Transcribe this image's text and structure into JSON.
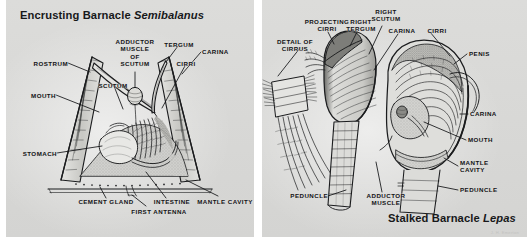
{
  "figure": {
    "kind": "anatomical-illustration",
    "panels": 2,
    "background_color": "#d8d8d6",
    "ink_color": "#1b1c1e",
    "signature": "J. H. Emerton"
  },
  "left_panel": {
    "title_prefix": "Encrusting Barnacle ",
    "title_genus": "Semibalanus",
    "view": "vertical section through conical shell",
    "labels": [
      {
        "id": "rostrum",
        "text": "ROSTRUM",
        "lines": [
          "ROSTRUM"
        ],
        "align": "right"
      },
      {
        "id": "mouth",
        "text": "MOUTH",
        "lines": [
          "MOUTH"
        ],
        "align": "right"
      },
      {
        "id": "stomach",
        "text": "STOMACH",
        "lines": [
          "STOMACH"
        ],
        "align": "right"
      },
      {
        "id": "adductor-muscle-of-scutum",
        "text": "ADDUCTOR MUSCLE OF SCUTUM",
        "lines": [
          "ADDUCTOR",
          "MUSCLE",
          "OF",
          "SCUTUM"
        ],
        "align": "center"
      },
      {
        "id": "tergum",
        "text": "TERGUM",
        "lines": [
          "TERGUM"
        ],
        "align": "center"
      },
      {
        "id": "carina",
        "text": "CARINA",
        "lines": [
          "CARINA"
        ],
        "align": "left"
      },
      {
        "id": "cirri",
        "text": "CIRRI",
        "lines": [
          "CIRRI"
        ],
        "align": "center"
      },
      {
        "id": "scutum",
        "text": "SCUTUM",
        "lines": [
          "SCUTUM"
        ],
        "align": "center"
      },
      {
        "id": "cement-gland",
        "text": "CEMENT GLAND",
        "lines": [
          "CEMENT GLAND"
        ],
        "align": "center"
      },
      {
        "id": "first-antenna",
        "text": "FIRST ANTENNA",
        "lines": [
          "FIRST ANTENNA"
        ],
        "align": "center"
      },
      {
        "id": "intestine",
        "text": "INTESTINE",
        "lines": [
          "INTESTINE"
        ],
        "align": "center"
      },
      {
        "id": "mantle-cavity",
        "text": "MANTLE CAVITY",
        "lines": [
          "MANTLE CAVITY"
        ],
        "align": "center"
      }
    ]
  },
  "right_panel": {
    "title_prefix": "Stalked Barnacle ",
    "title_genus": "Lepas",
    "view": "detail of cirrus, whole animal, and opened capitulum",
    "labels": [
      {
        "id": "detail-of-cirrus",
        "text": "DETAIL OF CIRRUS",
        "lines": [
          "DETAIL OF",
          "CIRRUS"
        ],
        "align": "center"
      },
      {
        "id": "projecting-cirri",
        "text": "PROJECTING CIRRI",
        "lines": [
          "PROJECTING",
          "CIRRI"
        ],
        "align": "center"
      },
      {
        "id": "right-tergum",
        "text": "RIGHT TERGUM",
        "lines": [
          "RIGHT",
          "TERGUM"
        ],
        "align": "center"
      },
      {
        "id": "right-scutum",
        "text": "RIGHT SCUTUM",
        "lines": [
          "RIGHT",
          "SCUTUM"
        ],
        "align": "center"
      },
      {
        "id": "carina-upper",
        "text": "CARINA",
        "lines": [
          "CARINA"
        ],
        "align": "center"
      },
      {
        "id": "cirri",
        "text": "CIRRI",
        "lines": [
          "CIRRI"
        ],
        "align": "center"
      },
      {
        "id": "penis",
        "text": "PENIS",
        "lines": [
          "PENIS"
        ],
        "align": "left"
      },
      {
        "id": "carina-right",
        "text": "CARINA",
        "lines": [
          "CARINA"
        ],
        "align": "left"
      },
      {
        "id": "mouth",
        "text": "MOUTH",
        "lines": [
          "MOUTH"
        ],
        "align": "left"
      },
      {
        "id": "mantle-cavity",
        "text": "MANTLE CAVITY",
        "lines": [
          "MANTLE",
          "CAVITY"
        ],
        "align": "left"
      },
      {
        "id": "peduncle-right",
        "text": "PEDUNCLE",
        "lines": [
          "PEDUNCLE"
        ],
        "align": "left"
      },
      {
        "id": "peduncle-left",
        "text": "PEDUNCLE",
        "lines": [
          "PEDUNCLE"
        ],
        "align": "right"
      },
      {
        "id": "adductor-muscle",
        "text": "ADDUCTOR MUSCLE",
        "lines": [
          "ADDUCTOR",
          "MUSCLE"
        ],
        "align": "center"
      }
    ]
  }
}
